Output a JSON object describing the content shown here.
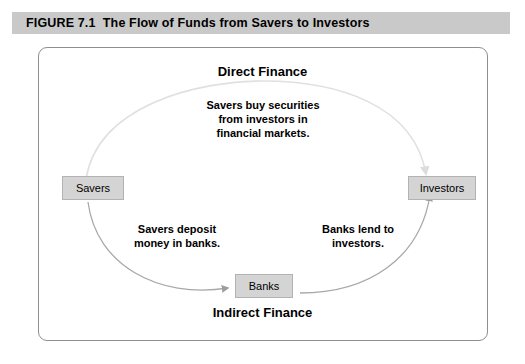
{
  "figure": {
    "label": "FIGURE",
    "number": "7.1",
    "title": "The Flow of Funds from Savers to Investors",
    "caption_full": "FIGURE 7.1  The Flow of Funds from Savers to Investors"
  },
  "diagram": {
    "headings": {
      "top": "Direct Finance",
      "bottom": "Indirect Finance"
    },
    "nodes": {
      "savers": "Savers",
      "investors": "Investors",
      "banks": "Banks"
    },
    "annotations": {
      "direct": {
        "line1": "Savers buy securities",
        "line2": "from investors in",
        "line3": "financial markets."
      },
      "deposit": {
        "line1": "Savers deposit",
        "line2": "money in banks."
      },
      "lend": {
        "line1": "Banks lend to",
        "line2": "investors."
      }
    },
    "colors": {
      "caption_band": "#c9c9c9",
      "node_fill": "#d4d4d4",
      "node_border": "#b3b3b3",
      "frame_border": "#8f8f8f",
      "arrow_light": "#dedede",
      "arrow_dark": "#a0a0a0",
      "text": "#000000"
    }
  }
}
